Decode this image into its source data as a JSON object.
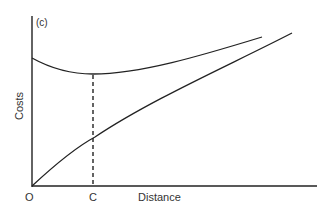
{
  "diagram": {
    "panel_label": "(c)",
    "y_axis_label": "Costs",
    "x_axis_label": "Distance",
    "origin_label": "O",
    "marker_label": "C",
    "curves": [
      {
        "name": "U-shaped cost curve",
        "description": "Declines from y-axis intercept to a minimum at distance C, then rises"
      },
      {
        "name": "rising cost curve",
        "description": "Starts at origin and rises with distance, slightly concave"
      }
    ],
    "marker": {
      "type": "dashed vertical line",
      "from": "minimum of U-shaped curve",
      "to": "x-axis at C"
    }
  }
}
